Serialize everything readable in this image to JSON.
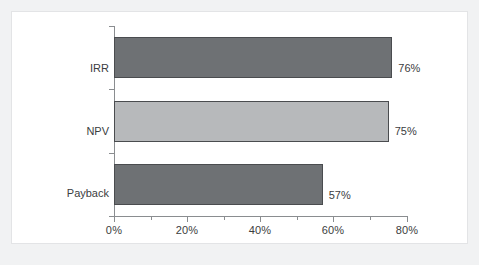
{
  "chart_data": {
    "type": "bar",
    "orientation": "horizontal",
    "title": "",
    "subtitle": "",
    "xlabel": "",
    "ylabel": "",
    "categories": [
      "IRR",
      "NPV",
      "Payback"
    ],
    "values": [
      76,
      75,
      57
    ],
    "value_labels": [
      "76%",
      "75%",
      "57%"
    ],
    "xlim": [
      0,
      80
    ],
    "x_tick_values": [
      0,
      20,
      40,
      60,
      80
    ],
    "x_tick_labels": [
      "0%",
      "20%",
      "40%",
      "60%",
      "80%"
    ],
    "x_minor_tick_values": [
      10,
      30,
      50,
      70
    ],
    "grid": false,
    "legend": false,
    "legend_position": "none",
    "series": [
      {
        "name": "Usage",
        "values": [
          76,
          75,
          57
        ],
        "bar_colors": [
          "#6e7174",
          "#b7b9bb",
          "#6e7174"
        ],
        "bar_edge_color": "#4a4c4f"
      }
    ]
  },
  "figure": {
    "background_color": "#f1f2f3",
    "panel_color": "#ffffff",
    "panel_border_color": "#e3e4e6",
    "axis_color": "#8a8d90",
    "text_color": "#3b3d40"
  },
  "bars": [
    {
      "category": "IRR",
      "value": 76,
      "label": "76%",
      "color": "#6e7174"
    },
    {
      "category": "NPV",
      "value": 75,
      "label": "75%",
      "color": "#b7b9bb"
    },
    {
      "category": "Payback",
      "value": 57,
      "label": "57%",
      "color": "#6e7174"
    }
  ]
}
